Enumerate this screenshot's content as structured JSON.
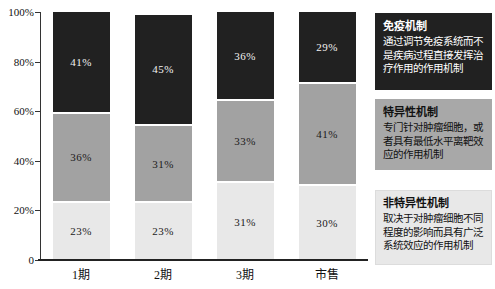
{
  "chart_data": {
    "type": "bar",
    "stacked": true,
    "percent": true,
    "title": "",
    "xlabel": "",
    "ylabel": "",
    "ylim": [
      0,
      100
    ],
    "grid": false,
    "legend_position": "right",
    "categories": [
      "1期",
      "2期",
      "3期",
      "市售"
    ],
    "y_ticks": [
      "100%",
      "80%",
      "60%",
      "40%",
      "20%",
      "0"
    ],
    "series": [
      {
        "name": "非特异性机制",
        "values": [
          23,
          23,
          31,
          30
        ],
        "color": "#e8e8e8",
        "label_color": "#1a1a1a"
      },
      {
        "name": "特异性机制",
        "values": [
          36,
          31,
          33,
          41
        ],
        "color": "#a2a2a2",
        "label_color": "#1a1a1a"
      },
      {
        "name": "免疫机制",
        "values": [
          41,
          45,
          36,
          29
        ],
        "color": "#212121",
        "label_color": "#f2f2f2"
      }
    ]
  },
  "legend": {
    "items": [
      {
        "title": "免疫机制",
        "body": "通过调节免疫系统而不是疾病过程直接发挥治疗作用的作用机制",
        "bg": "#212121",
        "fg": "#ffffff",
        "border": "#212121",
        "top": 13,
        "height": 77
      },
      {
        "title": "特异性机制",
        "body": "专门针对肿瘤细胞，或者具有最低水平离靶效应的作用机制",
        "bg": "#a8a8a8",
        "fg": "#111111",
        "border": "#a8a8a8",
        "top": 99,
        "height": 71
      },
      {
        "title": "非特异性机制",
        "body": "取决于对肿瘤细胞不同程度的影响而具有广泛系统效应的作用机制",
        "bg": "#e8e8e8",
        "fg": "#111111",
        "border": "#dcdcdc",
        "top": 190,
        "height": 75
      }
    ]
  }
}
